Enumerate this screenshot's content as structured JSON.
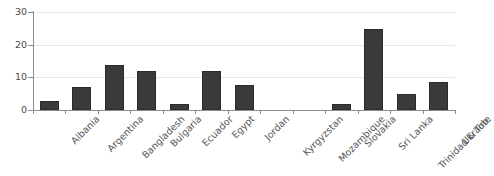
{
  "chart_data": {
    "type": "bar",
    "title": "",
    "subtitle": "",
    "xlabel": "",
    "ylabel": "",
    "ylim": [
      0,
      30
    ],
    "yticks": [
      0,
      10,
      20,
      30
    ],
    "ytick_labels": [
      "0",
      "10",
      "20",
      "30"
    ],
    "grid": true,
    "grid_axis": "y",
    "legend": false,
    "legend_position": "none",
    "orientation": "vertical",
    "categories": [
      "Albania",
      "Argentina",
      "Bangladesh",
      "Bulgaria",
      "Ecuador",
      "Egypt",
      "Jordan",
      "Kyrgyzstan",
      "Mozambique",
      "Slovakia",
      "Sri Lanka",
      "Trinidad & Tob.",
      "Ukraine"
    ],
    "values": [
      2.9,
      7.0,
      13.8,
      11.8,
      1.8,
      11.8,
      7.8,
      0,
      0,
      1.8,
      24.7,
      4.8,
      8.7
    ],
    "series": [
      {
        "name": "",
        "values": [
          2.9,
          7.0,
          13.8,
          11.8,
          1.8,
          11.8,
          7.8,
          0,
          0,
          1.8,
          24.7,
          4.8,
          8.7
        ]
      }
    ],
    "colors": {
      "bar": "#3a3a3a",
      "bar_edge": "#2b2b2b",
      "grid": "#e9e9e9",
      "axis": "#8d8d8d",
      "tick_label": "#4a4a4a",
      "category_label": "#555555",
      "background": "#ffffff"
    },
    "label_rotation": -45
  }
}
